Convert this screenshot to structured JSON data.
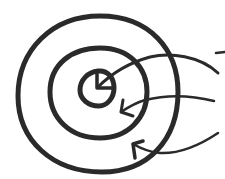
{
  "diagram": {
    "type": "concentric-circles-with-arrows",
    "style": "hand-drawn",
    "stroke_color": "#2a2a2a",
    "background": "#ffffff",
    "circles": [
      {
        "name": "outer-ring",
        "cx": 97,
        "cy": 94,
        "r": 80
      },
      {
        "name": "middle-ring",
        "cx": 97,
        "cy": 90,
        "r": 48
      },
      {
        "name": "inner-ring",
        "cx": 99,
        "cy": 87,
        "r": 18
      }
    ],
    "arrows": [
      {
        "name": "arrow-to-inner",
        "target": "inner-ring"
      },
      {
        "name": "arrow-to-middle",
        "target": "middle-ring"
      },
      {
        "name": "arrow-to-outer",
        "target": "outer-ring"
      }
    ]
  }
}
